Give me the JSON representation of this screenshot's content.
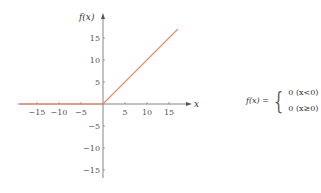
{
  "chart_data": {
    "type": "line",
    "title": "",
    "xlabel": "x",
    "ylabel": "f(x)",
    "xlim": [
      -19,
      20
    ],
    "ylim": [
      -17,
      20
    ],
    "x_ticks": [
      -15,
      -10,
      -5,
      5,
      10,
      15
    ],
    "y_ticks": [
      15,
      10,
      5,
      -5,
      -10,
      -15
    ],
    "grid": false,
    "series": [
      {
        "name": "f(x)",
        "color": "#e8805e",
        "x": [
          -19,
          0,
          17
        ],
        "y": [
          0,
          0,
          17
        ]
      }
    ]
  },
  "formula": {
    "lhs": "f(x) =",
    "cases": [
      "0 (x<0)",
      "0 (x≥0)"
    ]
  }
}
